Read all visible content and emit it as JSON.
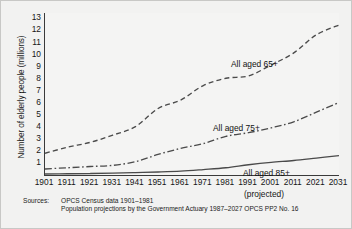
{
  "axes": {
    "ylabel": "Number of elderly people (millions)",
    "yticks": [
      1,
      2,
      3,
      4,
      5,
      6,
      7,
      8,
      9,
      10,
      11,
      12,
      13
    ],
    "xticks": [
      1901,
      1911,
      1921,
      1931,
      1941,
      1951,
      1961,
      1971,
      1981,
      1991,
      2001,
      2011,
      2021,
      2031
    ],
    "projected_note": "(projected)"
  },
  "series_labels": {
    "s65": "All aged 65+",
    "s75": "All aged 75+",
    "s85": "All aged 85+"
  },
  "sources": {
    "label": "Sources:",
    "line1": "OPCS Census data 1901–1981",
    "line2": "Population projections by the Government Actuary 1987–2027 OPCS PP2 No. 16"
  },
  "colors": {
    "axis": "#3a3a3a",
    "series": "#4a4a4a",
    "background": "#f2f2f1",
    "plot_background": "#f4f4f3"
  },
  "chart_data": {
    "type": "line",
    "title": "",
    "xlabel": "",
    "ylabel": "Number of elderly people (millions)",
    "xlim": [
      1901,
      2031
    ],
    "ylim": [
      0,
      13.4
    ],
    "grid": false,
    "legend": "inline-labels",
    "x": [
      1901,
      1911,
      1921,
      1931,
      1941,
      1951,
      1961,
      1971,
      1981,
      1991,
      2001,
      2011,
      2021,
      2031
    ],
    "series": [
      {
        "name": "All aged 65+",
        "style": "dashed",
        "values": [
          1.8,
          2.3,
          2.7,
          3.3,
          4.0,
          5.5,
          6.2,
          7.4,
          8.0,
          8.2,
          9.1,
          10.1,
          11.6,
          12.4
        ]
      },
      {
        "name": "All aged 75+",
        "style": "dash-dot",
        "values": [
          0.5,
          0.6,
          0.7,
          0.8,
          1.1,
          1.7,
          2.2,
          2.6,
          3.2,
          3.5,
          3.9,
          4.4,
          5.2,
          6.0
        ]
      },
      {
        "name": "All aged 85+",
        "style": "solid",
        "values": [
          0.08,
          0.1,
          0.12,
          0.15,
          0.2,
          0.25,
          0.32,
          0.45,
          0.6,
          0.85,
          1.05,
          1.2,
          1.4,
          1.6
        ]
      }
    ],
    "annotations": [
      "(projected)",
      "Sources: OPCS Census data 1901–1981",
      "Population projections by the Government Actuary 1987–2027 OPCS PP2 No. 16"
    ]
  }
}
